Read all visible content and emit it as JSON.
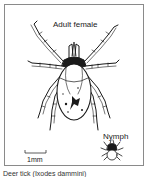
{
  "figure": {
    "labels": {
      "adult": "Adult female",
      "nymph": "Nymph",
      "scale": "1mm"
    },
    "caption": "Deer tick (Ixodes dammini)",
    "colors": {
      "ink": "#1a1a1a",
      "frame": "#8a8a8a",
      "background": "#ffffff"
    }
  }
}
